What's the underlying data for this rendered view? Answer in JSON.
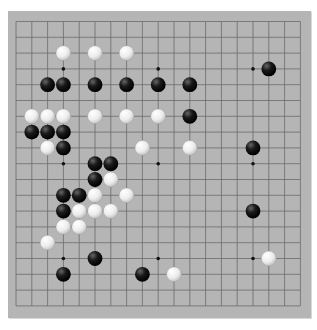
{
  "board": {
    "size": 19,
    "colors": {
      "background": "#b5b5b5",
      "line": "#6b6b6b",
      "black_stone": "#111111",
      "white_stone": "#f2f2f2"
    },
    "star_points": [
      [
        3,
        3
      ],
      [
        9,
        3
      ],
      [
        15,
        3
      ],
      [
        3,
        9
      ],
      [
        9,
        9
      ],
      [
        15,
        9
      ],
      [
        3,
        15
      ],
      [
        9,
        15
      ],
      [
        15,
        15
      ]
    ],
    "stones": {
      "black": [
        [
          16,
          3
        ],
        [
          2,
          4
        ],
        [
          3,
          4
        ],
        [
          5,
          4
        ],
        [
          7,
          4
        ],
        [
          9,
          4
        ],
        [
          11,
          4
        ],
        [
          11,
          6
        ],
        [
          1,
          7
        ],
        [
          2,
          7
        ],
        [
          3,
          7
        ],
        [
          3,
          8
        ],
        [
          15,
          8
        ],
        [
          5,
          9
        ],
        [
          6,
          9
        ],
        [
          5,
          10
        ],
        [
          3,
          11
        ],
        [
          4,
          11
        ],
        [
          3,
          12
        ],
        [
          15,
          12
        ],
        [
          5,
          15
        ],
        [
          3,
          16
        ],
        [
          8,
          16
        ]
      ],
      "white": [
        [
          3,
          2
        ],
        [
          5,
          2
        ],
        [
          7,
          2
        ],
        [
          1,
          6
        ],
        [
          2,
          6
        ],
        [
          3,
          6
        ],
        [
          5,
          6
        ],
        [
          7,
          6
        ],
        [
          9,
          6
        ],
        [
          2,
          8
        ],
        [
          8,
          8
        ],
        [
          11,
          8
        ],
        [
          6,
          10
        ],
        [
          5,
          11
        ],
        [
          7,
          11
        ],
        [
          4,
          12
        ],
        [
          5,
          12
        ],
        [
          6,
          12
        ],
        [
          3,
          13
        ],
        [
          4,
          13
        ],
        [
          2,
          14
        ],
        [
          16,
          15
        ],
        [
          10,
          16
        ]
      ]
    }
  }
}
